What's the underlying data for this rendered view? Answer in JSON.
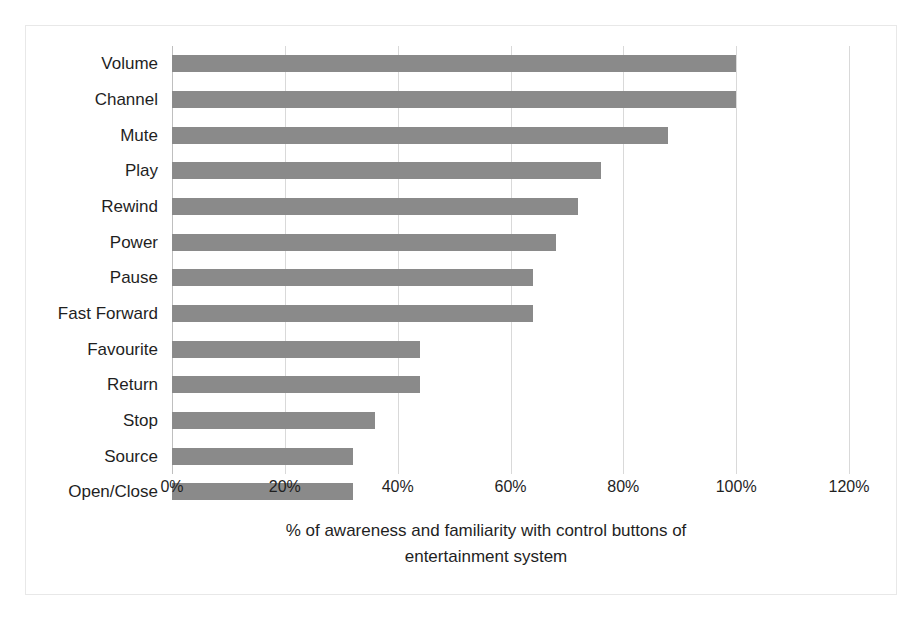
{
  "chart_data": {
    "type": "bar",
    "orientation": "horizontal",
    "title": "",
    "xlabel": "% of awareness and familiarity with control buttons of entertainment system",
    "ylabel": "",
    "xlim": [
      0,
      120
    ],
    "xticks": [
      "0%",
      "20%",
      "40%",
      "60%",
      "80%",
      "100%",
      "120%"
    ],
    "xtick_values": [
      0,
      20,
      40,
      60,
      80,
      100,
      120
    ],
    "grid": true,
    "legend": false,
    "bar_color": "#8a8a8a",
    "categories": [
      "Open/Close",
      "Source",
      "Stop",
      "Return",
      "Favourite",
      "Fast Forward",
      "Pause",
      "Power",
      "Rewind",
      "Play",
      "Mute",
      "Channel",
      "Volume"
    ],
    "values": [
      32,
      32,
      36,
      44,
      44,
      64,
      64,
      68,
      72,
      76,
      88,
      100,
      100
    ],
    "value_labels": [
      "32%",
      "32%",
      "36%",
      "44%",
      "44%",
      "64%",
      "64%",
      "68%",
      "72%",
      "76%",
      "88%",
      "100%",
      "100%"
    ]
  },
  "axis_title_lines": [
    "% of awareness and familiarity with control buttons of",
    "entertainment system"
  ]
}
